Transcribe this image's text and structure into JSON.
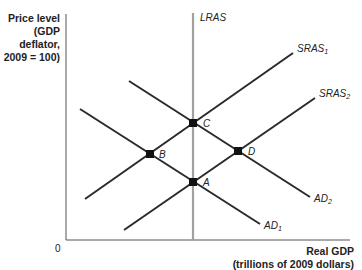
{
  "axes": {
    "y_label_lines": [
      "Price level",
      "(GDP",
      "deflator,",
      "2009 = 100)"
    ],
    "x_label_lines": [
      "Real GDP",
      "(trillions of 2009 dollars)"
    ],
    "origin": "0"
  },
  "curves": {
    "lras": {
      "label": "LRAS",
      "x": 193,
      "y1": 13,
      "y2": 240,
      "color": "#a0a0a0"
    },
    "sras1": {
      "label": "SRAS",
      "sub": "1",
      "x1": 85,
      "y1": 199,
      "x2": 293,
      "y2": 53
    },
    "sras2": {
      "label": "SRAS",
      "sub": "2",
      "x1": 124,
      "y1": 230,
      "x2": 315,
      "y2": 98
    },
    "ad1": {
      "label": "AD",
      "sub": "1",
      "x1": 80,
      "y1": 109,
      "x2": 260,
      "y2": 224
    },
    "ad2": {
      "label": "AD",
      "sub": "2",
      "x1": 129,
      "y1": 81,
      "x2": 310,
      "y2": 197
    }
  },
  "points": [
    {
      "label": "A",
      "x": 193,
      "y": 182
    },
    {
      "label": "B",
      "x": 150,
      "y": 154
    },
    {
      "label": "C",
      "x": 193,
      "y": 123
    },
    {
      "label": "D",
      "x": 238,
      "y": 151
    }
  ],
  "colors": {
    "curve": "#2a2a2a",
    "lras": "#a0a0a0",
    "axis": "#555555"
  }
}
